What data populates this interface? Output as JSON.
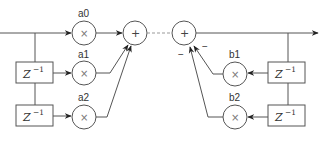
{
  "diagram": {
    "type": "IIR filter block diagram (direct form)",
    "feedforward": {
      "coefficients": [
        {
          "label": "a0",
          "operator": "×"
        },
        {
          "label": "a1",
          "operator": "×"
        },
        {
          "label": "a2",
          "operator": "×"
        }
      ],
      "delays": [
        {
          "base": "Z",
          "exponent": "−1"
        },
        {
          "base": "Z",
          "exponent": "−1"
        }
      ],
      "sum_operator": "+"
    },
    "feedback": {
      "coefficients": [
        {
          "label": "b1",
          "operator": "×"
        },
        {
          "label": "b2",
          "operator": "×"
        }
      ],
      "delays": [
        {
          "base": "Z",
          "exponent": "−1"
        },
        {
          "base": "Z",
          "exponent": "−1"
        }
      ],
      "sum_operator": "+",
      "input_signs": [
        "−",
        "−"
      ]
    },
    "colors": {
      "line": "#555555",
      "dashed_link": "#9a9a9a",
      "text": "#333333",
      "background": "#ffffff"
    }
  }
}
